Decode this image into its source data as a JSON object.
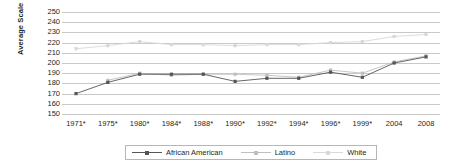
{
  "chart_data": {
    "type": "line",
    "title": "",
    "xlabel": "",
    "ylabel": "Average Scale Score",
    "ylim": [
      150,
      250
    ],
    "ytick_step": 10,
    "grid": true,
    "legend_position": "bottom",
    "categories": [
      "1971*",
      "1975*",
      "1980*",
      "1984*",
      "1988*",
      "1990*",
      "1992*",
      "1994*",
      "1996*",
      "1999*",
      "2004",
      "2008"
    ],
    "ytick_labels": [
      "250",
      "240",
      "230",
      "220",
      "210",
      "200",
      "190",
      "180",
      "170",
      "160",
      "150"
    ],
    "series": [
      {
        "name": "African American",
        "color": "#555555",
        "marker": "square",
        "values": [
          170,
          181,
          189,
          189,
          189,
          182,
          185,
          185,
          191,
          186,
          200,
          206
        ]
      },
      {
        "name": "Latino",
        "color": "#bfbfbf",
        "marker": "square",
        "values": [
          null,
          183,
          190,
          188,
          189,
          189,
          188,
          186,
          193,
          190,
          201,
          207
        ]
      },
      {
        "name": "White",
        "color": "#d8d8d8",
        "marker": "square",
        "values": [
          214,
          217,
          221,
          218,
          218,
          217,
          218,
          218,
          220,
          221,
          226,
          228
        ]
      }
    ]
  },
  "legend": {
    "items": [
      {
        "label": "African American"
      },
      {
        "label": "Latino"
      },
      {
        "label": "White"
      }
    ]
  },
  "axis": {
    "y_title": "Average Scale Score"
  }
}
